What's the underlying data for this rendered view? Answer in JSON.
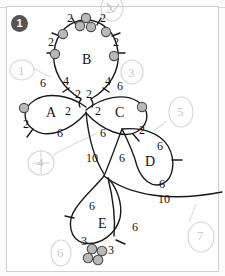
{
  "figure": {
    "badge": "1",
    "ink_color": "#111111",
    "annotation_color": "#c9c9c9",
    "node_fill": "#b9b9b9",
    "node_stroke": "#4a4a4a"
  },
  "rings": [
    {
      "id": "A",
      "label": "A"
    },
    {
      "id": "B",
      "label": "B"
    },
    {
      "id": "C",
      "label": "C"
    },
    {
      "id": "D",
      "label": "D"
    },
    {
      "id": "E",
      "label": "E"
    }
  ],
  "edge_labels": [
    {
      "id": "b-top-left",
      "text": "2",
      "x": 67,
      "y": 12
    },
    {
      "id": "b-top-right",
      "text": "2",
      "x": 100,
      "y": 12
    },
    {
      "id": "b-left-upper",
      "text": "2",
      "x": 48,
      "y": 36
    },
    {
      "id": "b-right-upper",
      "text": "2",
      "x": 113,
      "y": 36
    },
    {
      "id": "b-left-lower",
      "text": "2",
      "x": 23,
      "y": 118
    },
    {
      "id": "b-stem-left",
      "text": "4",
      "x": 63,
      "y": 75
    },
    {
      "id": "b-stem-right",
      "text": "4",
      "x": 105,
      "y": 75
    },
    {
      "id": "a-top",
      "text": "6",
      "x": 40,
      "y": 77
    },
    {
      "id": "a-bottom",
      "text": "6",
      "x": 57,
      "y": 127
    },
    {
      "id": "a-right",
      "text": "2",
      "x": 65,
      "y": 105
    },
    {
      "id": "center-nw",
      "text": "2",
      "x": 75,
      "y": 90
    },
    {
      "id": "center-ne",
      "text": "2",
      "x": 87,
      "y": 90
    },
    {
      "id": "center-e",
      "text": "2",
      "x": 95,
      "y": 105
    },
    {
      "id": "c-top",
      "text": "6",
      "x": 117,
      "y": 80
    },
    {
      "id": "c-bottom",
      "text": "6",
      "x": 100,
      "y": 127
    },
    {
      "id": "c-lower-right",
      "text": "2",
      "x": 139,
      "y": 124
    },
    {
      "id": "stem-ten",
      "text": "10",
      "x": 90,
      "y": 152
    },
    {
      "id": "d-left",
      "text": "6",
      "x": 119,
      "y": 152
    },
    {
      "id": "d-upper-right",
      "text": "6",
      "x": 157,
      "y": 140
    },
    {
      "id": "d-lower-right",
      "text": "6",
      "x": 159,
      "y": 178
    },
    {
      "id": "lower-ten",
      "text": "10",
      "x": 162,
      "y": 199
    },
    {
      "id": "e-upper-left",
      "text": "6",
      "x": 89,
      "y": 200
    },
    {
      "id": "e-right",
      "text": "6",
      "x": 132,
      "y": 221
    },
    {
      "id": "e-lower-left",
      "text": "3",
      "x": 85,
      "y": 238
    },
    {
      "id": "e-lower-right",
      "text": "3",
      "x": 110,
      "y": 246
    }
  ],
  "pencil_annotations": [
    {
      "id": "anno-2",
      "text": "2",
      "x": 107,
      "y": 2
    },
    {
      "id": "anno-1",
      "text": "1",
      "x": 17,
      "y": 64
    },
    {
      "id": "anno-3",
      "text": "3",
      "x": 128,
      "y": 66
    },
    {
      "id": "anno-5",
      "text": "5",
      "x": 176,
      "y": 105
    },
    {
      "id": "anno-4",
      "text": "4",
      "x": 36,
      "y": 155
    },
    {
      "id": "anno-6",
      "text": "6",
      "x": 56,
      "y": 245
    },
    {
      "id": "anno-7",
      "text": "7",
      "x": 196,
      "y": 228
    }
  ],
  "node_clusters": [
    {
      "id": "b-top-cluster",
      "count": 3
    },
    {
      "id": "e-bottom-cluster",
      "count": 4
    }
  ]
}
